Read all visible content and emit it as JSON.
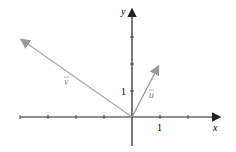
{
  "diagram": {
    "type": "vector-plot",
    "axes": {
      "x_label": "x",
      "y_label": "y",
      "x_tick_label": "1",
      "y_tick_label": "1",
      "axis_color": "#222222"
    },
    "vectors": [
      {
        "name": "u",
        "label": "u",
        "components": [
          1,
          2
        ],
        "color": "#999999"
      },
      {
        "name": "v",
        "label": "v",
        "components": [
          -4,
          3
        ],
        "color": "#aaaaaa"
      }
    ]
  }
}
